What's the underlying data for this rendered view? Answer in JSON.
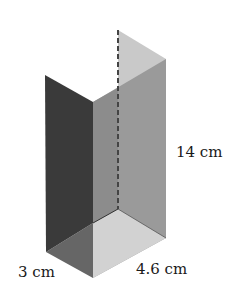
{
  "figure": {
    "type": "rectangular prism (cuboid) net/cutaway diagram",
    "dimensions": {
      "height": "14 cm",
      "width": "3 cm",
      "length": "4.6 cm"
    }
  },
  "labels": {
    "height": "14 cm",
    "width": "3 cm",
    "length": "4.6 cm"
  },
  "colors": {
    "left_face": "#3a3a3a",
    "front_face": "#8c8c8c",
    "right_face": "#9a9a9a",
    "back_panel_top": "#c9c9c9",
    "floor_light": "#d2d2d2",
    "floor_dark": "#666666",
    "dashed_edge": "#444444"
  }
}
